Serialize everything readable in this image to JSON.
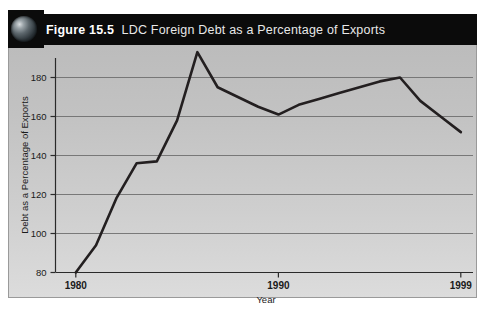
{
  "figure": {
    "icon": "globe-icon",
    "number_label": "Figure 15.5",
    "title_rest": "LDC  Foreign Debt as a Percentage of Exports",
    "titlebar_color": "#0b0b0b",
    "plate_color": "#c6c6c6",
    "line_color": "#231f20"
  },
  "chart_data": {
    "type": "line",
    "xlabel": "Year",
    "ylabel": "Debt as a Percentage of Exports",
    "xlim": [
      1979,
      1999.6
    ],
    "ylim": [
      80,
      190
    ],
    "yticks": [
      80,
      100,
      120,
      140,
      160,
      180
    ],
    "ytick_labels": [
      "80",
      "100",
      "120",
      "140",
      "160",
      "180"
    ],
    "xticks": [
      1980,
      1990,
      1999
    ],
    "xtick_labels": [
      "1980",
      "1990",
      "1999"
    ],
    "grid": true,
    "grid_axis": "y",
    "legend": "none",
    "series": [
      {
        "name": "LDC foreign debt as % of exports",
        "x": [
          1980,
          1981,
          1982,
          1983,
          1984,
          1985,
          1986,
          1987,
          1988,
          1989,
          1990,
          1991,
          1992,
          1993,
          1994,
          1995,
          1996,
          1997,
          1998,
          1999
        ],
        "values": [
          80,
          94,
          118,
          136,
          137,
          158,
          193,
          175,
          170,
          165,
          161,
          166,
          169,
          172,
          175,
          178,
          180,
          168,
          160,
          152
        ]
      }
    ]
  }
}
